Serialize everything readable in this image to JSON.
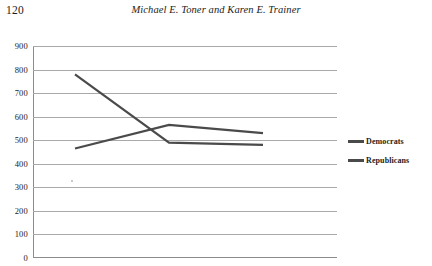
{
  "page": {
    "folio": "120",
    "running_head": "Michael E. Toner and Karen E. Trainer"
  },
  "chart_data": {
    "type": "line",
    "title": "",
    "subtitle": "",
    "xlabel": "",
    "ylabel": "",
    "categories": [
      "2006",
      "2010",
      "2014"
    ],
    "x": [
      2006,
      2010,
      2014
    ],
    "series": [
      {
        "name": "Democrats",
        "values": [
          465,
          565,
          530
        ],
        "color": "#4a4a4a"
      },
      {
        "name": "Republicans",
        "values": [
          780,
          490,
          480
        ],
        "color": "#4a4a4a"
      }
    ],
    "ylim": [
      0,
      900
    ],
    "yticks": [
      900,
      800,
      700,
      600,
      500,
      400,
      300,
      200,
      100,
      0
    ],
    "ytick_labels": [
      "900",
      "800",
      "700",
      "600",
      "500",
      "400",
      "300",
      "200",
      "100",
      "0"
    ],
    "grid": true,
    "grid_axis": "y",
    "legend_position": "right",
    "legend": [
      "Democrats",
      "Republicans"
    ]
  },
  "legend": {
    "items": [
      {
        "label": "Democrats",
        "color": "#4a4a4a"
      },
      {
        "label": "Republicans",
        "color": "#4a4a4a"
      }
    ]
  },
  "colors": {
    "democrats": "#4a4a4a",
    "republicans": "#4a4a4a",
    "gridline": "#a9a9a9",
    "axis": "#8c8c8c",
    "text": "#1c1c1c"
  }
}
